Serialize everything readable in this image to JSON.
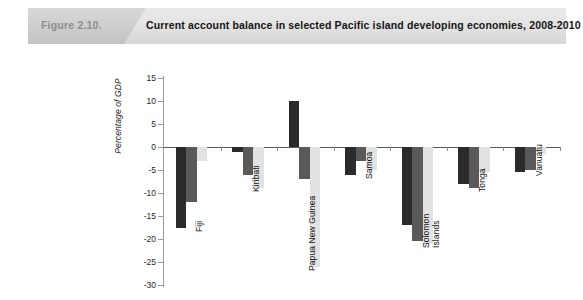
{
  "header": {
    "figure_number": "Figure 2.10.",
    "title": "Current account balance in selected Pacific island developing economies, 2008-2010"
  },
  "colors": {
    "series_2008": "#2b2b2b",
    "series_2009": "#595959",
    "series_2010": "#e2e2e2",
    "axis": "#9a9a9a",
    "zero_line": "#5a5a5a",
    "banner_left": "#cfcfcf",
    "banner_right": "#e3e3e3",
    "figure_number_color": "#8e8e8e"
  },
  "legend": {
    "position": "bottom-right",
    "items": [
      {
        "label": "2008",
        "color": "#2b2b2b"
      },
      {
        "label": "2009",
        "color": "#595959"
      },
      {
        "label": "2010",
        "color": "#e2e2e2"
      }
    ]
  },
  "chart_data": {
    "type": "bar",
    "title": "Current account balance in selected Pacific island developing economies, 2008-2010",
    "subtitle": "",
    "xlabel": "",
    "ylabel": "Percentage of GDP",
    "ylim": [
      -30,
      15
    ],
    "yticks": [
      15,
      10,
      5,
      0,
      -5,
      -10,
      -15,
      -20,
      -25,
      -30
    ],
    "ytick_labels": [
      "15",
      "10",
      "5",
      "0",
      "-5",
      "-10",
      "-15",
      "-20",
      "-25",
      "-30"
    ],
    "grid": false,
    "legend_position": "bottom-right",
    "categories": [
      "Fiji",
      "Kiribati",
      "Papua New Guinea",
      "Samoa",
      "Solomon Islands",
      "Tonga",
      "Vanuatu"
    ],
    "series": [
      {
        "name": "2008",
        "color": "#2b2b2b",
        "values": [
          -17.5,
          -1.0,
          10.0,
          -6.0,
          -17.0,
          -8.0,
          -5.5
        ]
      },
      {
        "name": "2009",
        "color": "#595959",
        "values": [
          -12.0,
          -6.0,
          -7.0,
          -3.0,
          -20.5,
          -9.0,
          -5.0
        ]
      },
      {
        "name": "2010",
        "color": "#e2e2e2",
        "values": [
          -3.0,
          -9.0,
          -26.0,
          -5.0,
          -21.0,
          -5.5,
          -1.5
        ]
      }
    ]
  }
}
